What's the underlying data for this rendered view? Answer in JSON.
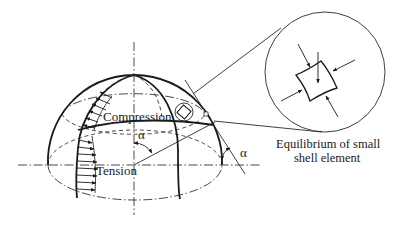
{
  "figure": {
    "labels": {
      "compression": "Compression",
      "tension": "Tension",
      "alpha_center": "α",
      "alpha_right": "α",
      "caption_line1": "Equilibrium of small",
      "caption_line2": "shell element"
    },
    "colors": {
      "ink": "#1a1a1a",
      "background": "#ffffff"
    },
    "elements": {
      "dome": "hemispherical shell with meridians and latitude circles",
      "stress_arrows_compression_count": 6,
      "stress_arrows_tension_count": 8,
      "detail_callout": "magnified shell element with four in-plane compressive force arrows and one normal load arrow"
    }
  }
}
